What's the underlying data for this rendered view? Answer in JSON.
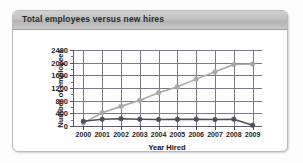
{
  "panel": {
    "title": "Total employees versus new hires"
  },
  "chart_data": {
    "type": "line",
    "title": "Total employees versus new hires",
    "xlabel": "Year Hired",
    "ylabel": "Number of employees",
    "categories": [
      "2000",
      "2001",
      "2002",
      "2003",
      "2004",
      "2005",
      "2006",
      "2007",
      "2008",
      "2009"
    ],
    "xtick_labels": [
      "2000",
      "2001",
      "2002",
      "2003",
      "2004",
      "2005",
      "2006",
      "2007",
      "2008",
      "2009"
    ],
    "ytick_labels": [
      "0",
      "400",
      "800",
      "1200",
      "1600",
      "2000",
      "2400"
    ],
    "ytick_values": [
      0,
      400,
      800,
      1200,
      1600,
      2000,
      2400
    ],
    "ylim": [
      0,
      2400
    ],
    "grid": "both",
    "legend": "none",
    "series": [
      {
        "name": "Total employees",
        "color": "#a8a8a8",
        "marker": "circle",
        "values": [
          100,
          420,
          620,
          810,
          1050,
          1240,
          1480,
          1710,
          1940,
          1960
        ]
      },
      {
        "name": "New hires",
        "color": "#4f4f5c",
        "marker": "circle",
        "values": [
          150,
          215,
          230,
          215,
          205,
          210,
          215,
          205,
          215,
          25
        ]
      }
    ]
  },
  "colors": {
    "titlebar": "#c2c2c2",
    "panel_border": "#b9b9b9",
    "axis": "#5e5e6b",
    "grid": "#7a7a86",
    "series_total": "#a8a8a8",
    "series_hires": "#4f4f5c"
  }
}
